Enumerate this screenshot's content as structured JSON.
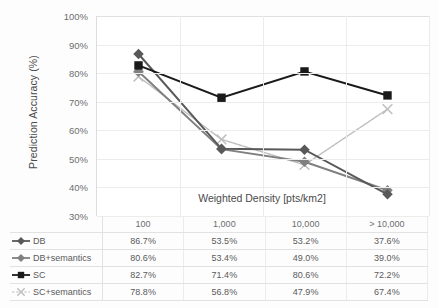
{
  "chart_data": {
    "type": "line",
    "title": "",
    "xlabel": "Weighted Density [pts/km2]",
    "ylabel": "Prediction Accuracy (%)",
    "categories": [
      "100",
      "1,000",
      "10,000",
      "> 10,000"
    ],
    "ylim": [
      30,
      100
    ],
    "yticks": [
      "30%",
      "40%",
      "50%",
      "60%",
      "70%",
      "80%",
      "90%",
      "100%"
    ],
    "ytick_values": [
      30,
      40,
      50,
      60,
      70,
      80,
      90,
      100
    ],
    "grid": true,
    "legend_position": "table-left",
    "series": [
      {
        "name": "DB",
        "marker": "diamond",
        "color": "#595959",
        "line": "solid",
        "values": [
          86.7,
          53.5,
          53.2,
          37.6
        ],
        "labels": [
          "86.7%",
          "53.5%",
          "53.2%",
          "37.6%"
        ]
      },
      {
        "name": "DB+semantics",
        "marker": "diamond",
        "color": "#808080",
        "line": "solid",
        "values": [
          80.6,
          53.4,
          49.0,
          39.0
        ],
        "labels": [
          "80.6%",
          "53.4%",
          "49.0%",
          "39.0%"
        ]
      },
      {
        "name": "SC",
        "marker": "square",
        "color": "#1a1a1a",
        "line": "solid",
        "values": [
          82.7,
          71.4,
          80.6,
          72.2
        ],
        "labels": [
          "82.7%",
          "71.4%",
          "80.6%",
          "72.2%"
        ]
      },
      {
        "name": "SC+semantics",
        "marker": "cross",
        "color": "#bfbfbf",
        "line": "dashed",
        "values": [
          78.8,
          56.8,
          47.9,
          67.4
        ],
        "labels": [
          "78.8%",
          "56.8%",
          "47.9%",
          "67.4%"
        ]
      }
    ]
  },
  "table": {
    "header_blank": "",
    "columns": [
      "100",
      "1,000",
      "10,000",
      "> 10,000"
    ],
    "rows": [
      {
        "key": "DB",
        "cells": [
          "86.7%",
          "53.5%",
          "53.2%",
          "37.6%"
        ]
      },
      {
        "key": "DB+semantics",
        "cells": [
          "80.6%",
          "53.4%",
          "49.0%",
          "39.0%"
        ]
      },
      {
        "key": "SC",
        "cells": [
          "82.7%",
          "71.4%",
          "80.6%",
          "72.2%"
        ]
      },
      {
        "key": "SC+semantics",
        "cells": [
          "78.8%",
          "56.8%",
          "47.9%",
          "67.4%"
        ]
      }
    ]
  },
  "colors": {
    "db": "#595959",
    "db_semantics": "#808080",
    "sc": "#1a1a1a",
    "sc_semantics": "#bfbfbf",
    "grid": "#ececec",
    "axis": "#dcdcdc"
  }
}
